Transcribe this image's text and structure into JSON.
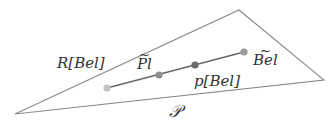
{
  "diagram": {
    "region_label": "𝒫",
    "polytope_label": "R[Bel]",
    "points": [
      {
        "name": "endpoint-left",
        "label": "",
        "color": "#c2c2c2"
      },
      {
        "name": "pl-tilde",
        "label": "Pl",
        "tilde": true,
        "color": "#8f8f8f"
      },
      {
        "name": "p-bel",
        "label": "p[Bel]",
        "tilde": false,
        "color": "#6a6a6a"
      },
      {
        "name": "bel-tilde",
        "label": "Bel",
        "tilde": true,
        "color": "#9a9a9a"
      }
    ],
    "colors": {
      "triangle_stroke": "#8a8a8a",
      "segment_stroke": "#666666",
      "text": "#333333"
    }
  }
}
